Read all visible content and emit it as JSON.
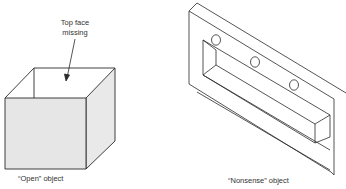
{
  "figure": {
    "left": {
      "annotation_line1": "Top face",
      "annotation_line2": "missing",
      "caption": "“Open” object"
    },
    "right": {
      "caption": "“Nonsense” object"
    }
  },
  "colors": {
    "stroke": "#2a2a2a",
    "face_fill": "#e6e6e6",
    "background": "#ffffff"
  }
}
